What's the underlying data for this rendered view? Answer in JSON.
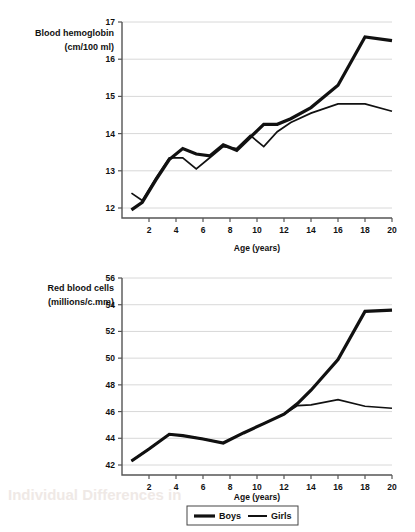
{
  "page": {
    "background": "#ffffff",
    "ink": "#111111",
    "grid_color": "#d8d8d8",
    "axis_color": "#555555"
  },
  "legend": {
    "position": "bottom-center",
    "entries": [
      {
        "label": "Boys",
        "style": "thick-line",
        "color": "#111111"
      },
      {
        "label": "Girls",
        "style": "thin-line",
        "color": "#111111"
      }
    ]
  },
  "chart_data": [
    {
      "type": "line",
      "title": "",
      "ylabel_line1": "Blood hemoglobin",
      "ylabel_line2": "(cm/100 ml)",
      "xlabel": "Age (years)",
      "grid": true,
      "legend_position": "bottom",
      "xlim": [
        0,
        20
      ],
      "ylim": [
        12,
        17
      ],
      "xticks": [
        2,
        4,
        6,
        8,
        10,
        12,
        14,
        16,
        18,
        20
      ],
      "yticks": [
        12,
        13,
        14,
        15,
        16,
        17
      ],
      "series": [
        {
          "name": "Boys",
          "x": [
            0.7,
            1.5,
            2.5,
            3.5,
            4.5,
            5.5,
            6.5,
            7.5,
            8.5,
            9.5,
            10.5,
            11.5,
            12.5,
            14,
            16,
            18,
            20
          ],
          "values": [
            11.95,
            12.15,
            12.75,
            13.3,
            13.6,
            13.45,
            13.4,
            13.7,
            13.55,
            13.9,
            14.25,
            14.25,
            14.4,
            14.7,
            15.3,
            16.6,
            16.5
          ]
        },
        {
          "name": "Girls",
          "x": [
            0.7,
            1.5,
            2.5,
            3.5,
            4.5,
            5.5,
            6.5,
            7.5,
            8.5,
            9.5,
            10.5,
            11.5,
            12.5,
            14,
            16,
            18,
            20
          ],
          "values": [
            12.4,
            12.2,
            12.8,
            13.35,
            13.35,
            13.05,
            13.35,
            13.65,
            13.6,
            13.95,
            13.65,
            14.05,
            14.3,
            14.55,
            14.8,
            14.8,
            14.6
          ]
        }
      ]
    },
    {
      "type": "line",
      "title": "",
      "ylabel_line1": "Red blood cells",
      "ylabel_line2": "(millions/c.mm)",
      "xlabel": "Age (years)",
      "grid": true,
      "legend_position": "bottom",
      "xlim": [
        0,
        20
      ],
      "ylim": [
        42,
        56
      ],
      "xticks": [
        2,
        4,
        6,
        8,
        10,
        12,
        14,
        16,
        18,
        20
      ],
      "yticks": [
        42,
        44,
        46,
        48,
        50,
        52,
        54,
        56
      ],
      "series": [
        {
          "name": "Boys",
          "x": [
            0.7,
            2,
            3.5,
            4.5,
            6,
            7.5,
            9,
            10.5,
            12,
            13,
            14,
            16,
            18,
            20
          ],
          "values": [
            42.3,
            43.2,
            44.3,
            44.2,
            43.95,
            43.65,
            44.4,
            45.1,
            45.8,
            46.6,
            47.6,
            49.9,
            53.5,
            53.6
          ]
        },
        {
          "name": "Girls",
          "x": [
            0.7,
            2,
            3.5,
            4.5,
            6,
            7.5,
            9,
            10.5,
            12,
            13,
            14,
            16,
            18,
            20
          ],
          "values": [
            42.3,
            43.2,
            44.3,
            44.2,
            43.95,
            43.65,
            44.4,
            45.1,
            45.8,
            46.45,
            46.5,
            46.9,
            46.4,
            46.25
          ]
        }
      ]
    }
  ]
}
